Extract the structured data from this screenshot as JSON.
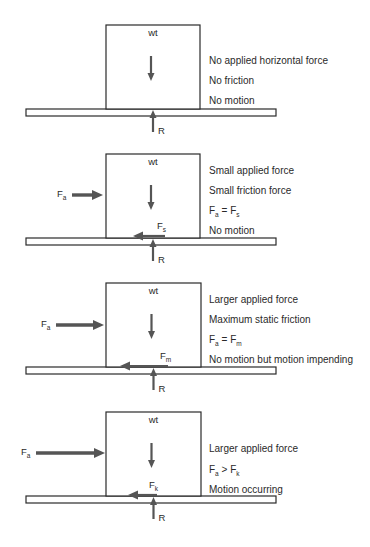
{
  "diagram": {
    "panels": [
      {
        "id": "panel-1",
        "box": {
          "x": 106,
          "y": 25,
          "w": 94,
          "h": 84
        },
        "floor": {
          "x": 26,
          "y": 109,
          "w": 250,
          "h": 7
        },
        "weight_label": "wt",
        "reaction_label": "R",
        "applied_force": null,
        "friction_force": null,
        "descriptions": [
          "No applied horizontal force",
          "No friction",
          "No motion"
        ],
        "desc_y": [
          64,
          84,
          104
        ]
      },
      {
        "id": "panel-2",
        "box": {
          "x": 106,
          "y": 154,
          "w": 94,
          "h": 84
        },
        "floor": {
          "x": 26,
          "y": 238,
          "w": 250,
          "h": 7
        },
        "weight_label": "wt",
        "reaction_label": "R",
        "applied_force": {
          "label": "F",
          "sub": "a",
          "x1": 72,
          "x2": 103,
          "y": 195,
          "thickness": "thick"
        },
        "friction_force": {
          "label": "F",
          "sub": "s",
          "x1": 165,
          "x2": 133,
          "y": 237
        },
        "descriptions": [
          "Small applied force",
          "Small friction force",
          "F_a = F_s",
          "No motion"
        ],
        "descriptions_rich": [
          [
            {
              "t": "Small applied force"
            }
          ],
          [
            {
              "t": "Small friction force"
            }
          ],
          [
            {
              "t": "F"
            },
            {
              "s": "a"
            },
            {
              "t": " = F"
            },
            {
              "s": "s"
            }
          ],
          [
            {
              "t": "No motion"
            }
          ]
        ],
        "desc_y": [
          174,
          194,
          214,
          234
        ]
      },
      {
        "id": "panel-3",
        "box": {
          "x": 106,
          "y": 283,
          "w": 95,
          "h": 84
        },
        "floor": {
          "x": 26,
          "y": 367,
          "w": 250,
          "h": 7
        },
        "weight_label": "wt",
        "reaction_label": "R",
        "applied_force": {
          "label": "F",
          "sub": "a",
          "x1": 56,
          "x2": 104,
          "y": 325,
          "thickness": "thick"
        },
        "friction_force": {
          "label": "F",
          "sub": "m",
          "x1": 168,
          "x2": 120,
          "y": 367
        },
        "descriptions": [
          "Larger applied force",
          "Maximum static friction",
          "F_a = F_m",
          "No motion but motion impending"
        ],
        "descriptions_rich": [
          [
            {
              "t": "Larger applied force"
            }
          ],
          [
            {
              "t": "Maximum static friction"
            }
          ],
          [
            {
              "t": "F"
            },
            {
              "s": "a"
            },
            {
              "t": " = F"
            },
            {
              "s": "m"
            }
          ],
          [
            {
              "t": "No motion but motion impending"
            }
          ]
        ],
        "desc_y": [
          303,
          323,
          343,
          363
        ]
      },
      {
        "id": "panel-4",
        "box": {
          "x": 106,
          "y": 412,
          "w": 95,
          "h": 84
        },
        "floor": {
          "x": 26,
          "y": 496,
          "w": 250,
          "h": 7
        },
        "weight_label": "wt",
        "reaction_label": "R",
        "applied_force": {
          "label": "F",
          "sub": "a",
          "x1": 36,
          "x2": 105,
          "y": 453,
          "thickness": "thick"
        },
        "friction_force": {
          "label": "F",
          "sub": "k",
          "x1": 157,
          "x2": 128,
          "y": 496
        },
        "descriptions": [
          "Larger applied force",
          "F_a > F_k",
          "Motion occurring"
        ],
        "descriptions_rich": [
          [
            {
              "t": "Larger applied force"
            }
          ],
          [
            {
              "t": "F"
            },
            {
              "s": "a"
            },
            {
              "t": " > F"
            },
            {
              "s": "k"
            }
          ],
          [
            {
              "t": "Motion occurring"
            }
          ]
        ],
        "desc_y": [
          452,
          473,
          493
        ]
      }
    ],
    "colors": {
      "line": "#2a2a2a",
      "arrow": "#555555",
      "background": "#ffffff"
    }
  }
}
